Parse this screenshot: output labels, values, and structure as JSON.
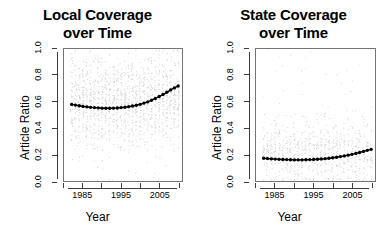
{
  "figure": {
    "background": "#ffffff",
    "point_color": "#d0d0d0",
    "trend_color": "#000000",
    "axis_color": "#3d3d3d"
  },
  "chart_data": [
    {
      "type": "scatter",
      "panel": "left",
      "title": "Local Coverage over Time",
      "title_line1": "Local Coverage",
      "title_line2": "over Time",
      "xlabel": "Year",
      "ylabel": "Article Ratio",
      "xlim": [
        1980,
        2011
      ],
      "ylim": [
        0.0,
        1.0
      ],
      "grid": false,
      "legend": "none",
      "xticks": [
        1985,
        1995,
        2005
      ],
      "xticks_minor": [
        1980,
        1990,
        2000,
        2010
      ],
      "yticks": [
        0.0,
        0.2,
        0.4,
        0.6,
        0.8,
        1.0
      ],
      "ytick_labels": [
        "0.0",
        "0.2",
        "0.4",
        "0.6",
        "0.8",
        "1.0"
      ],
      "series": [
        {
          "name": "Yearly mean article ratio",
          "style": "filled-circle-line",
          "x": [
            1982,
            1983,
            1984,
            1985,
            1986,
            1987,
            1988,
            1989,
            1990,
            1991,
            1992,
            1993,
            1994,
            1995,
            1996,
            1997,
            1998,
            1999,
            2000,
            2001,
            2002,
            2003,
            2004,
            2005,
            2006,
            2007,
            2008,
            2009,
            2010
          ],
          "values": [
            0.58,
            0.575,
            0.57,
            0.565,
            0.562,
            0.558,
            0.556,
            0.554,
            0.552,
            0.551,
            0.551,
            0.552,
            0.553,
            0.556,
            0.559,
            0.563,
            0.568,
            0.574,
            0.581,
            0.59,
            0.6,
            0.612,
            0.625,
            0.64,
            0.655,
            0.672,
            0.69,
            0.705,
            0.72
          ]
        },
        {
          "name": "Individual article observations",
          "style": "light-gray-points",
          "description": "Dense vertical bands of light gray points, one band per year, spanning ratios 0.0 to 1.0 with highest density between 0.35 and 0.85"
        }
      ]
    },
    {
      "type": "scatter",
      "panel": "right",
      "title": "State Coverage over Time",
      "title_line1": "State Coverage",
      "title_line2": "over Time",
      "xlabel": "Year",
      "ylabel": "Article Ratio",
      "xlim": [
        1980,
        2011
      ],
      "ylim": [
        0.0,
        1.0
      ],
      "grid": false,
      "legend": "none",
      "xticks": [
        1985,
        1995,
        2005
      ],
      "xticks_minor": [
        1980,
        1990,
        2000,
        2010
      ],
      "yticks": [
        0.0,
        0.2,
        0.4,
        0.6,
        0.8,
        1.0
      ],
      "ytick_labels": [
        "0.0",
        "0.2",
        "0.4",
        "0.6",
        "0.8",
        "1.0"
      ],
      "series": [
        {
          "name": "Yearly mean article ratio",
          "style": "filled-circle-line",
          "x": [
            1982,
            1983,
            1984,
            1985,
            1986,
            1987,
            1988,
            1989,
            1990,
            1991,
            1992,
            1993,
            1994,
            1995,
            1996,
            1997,
            1998,
            1999,
            2000,
            2001,
            2002,
            2003,
            2004,
            2005,
            2006,
            2007,
            2008,
            2009,
            2010
          ],
          "values": [
            0.172,
            0.17,
            0.168,
            0.166,
            0.164,
            0.163,
            0.162,
            0.161,
            0.16,
            0.16,
            0.16,
            0.161,
            0.162,
            0.163,
            0.165,
            0.167,
            0.169,
            0.172,
            0.176,
            0.18,
            0.185,
            0.19,
            0.196,
            0.202,
            0.209,
            0.216,
            0.224,
            0.232,
            0.24
          ]
        },
        {
          "name": "Individual article observations",
          "style": "light-gray-points",
          "description": "Sparse light gray points per year, densest between 0.05 and 0.40, thinning above 0.55"
        }
      ]
    }
  ]
}
